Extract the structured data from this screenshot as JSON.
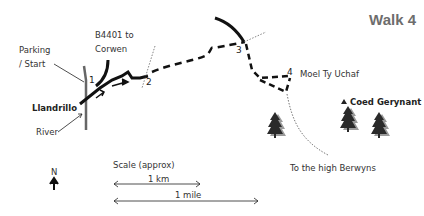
{
  "title": "Walk 4",
  "labels": {
    "parking": "Parking",
    "start": "/ Start",
    "road_line1": "B4401 to",
    "road_line2": "Corwen",
    "village": "Llandrillo",
    "river": "River",
    "hill": "Moel Ty Uchaf",
    "wood": "Coed Gerynant",
    "direction": "To the high Berwyns"
  },
  "waypoints": [
    "1",
    "2",
    "3",
    "4"
  ],
  "compass": {
    "label": "N",
    "icon": "north-arrow-icon"
  },
  "scale": {
    "title": "Scale (approx)",
    "km_label": "1 km",
    "mile_label": "1 mile"
  },
  "colors": {
    "route": "#1a1a1a",
    "title": "#6d6d6d",
    "tree": "#2a2a2a",
    "tree_shadow": "#9a9a9a"
  }
}
